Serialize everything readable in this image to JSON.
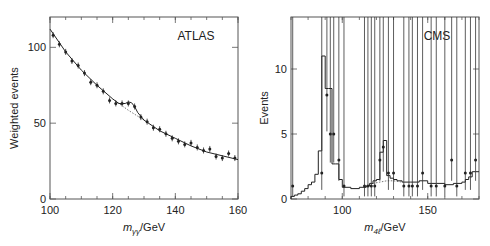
{
  "chart_data": [
    {
      "type": "scatter",
      "title": "",
      "experiment_label": "ATLAS",
      "xlabel": "m_γγ/GeV",
      "xlabel_italic": "m",
      "xlabel_sub": "γγ",
      "xlabel_unit": "/GeV",
      "ylabel": "Weighted events",
      "xlim": [
        100,
        160
      ],
      "ylim": [
        0,
        120
      ],
      "xticks": [
        100,
        120,
        140,
        160
      ],
      "yticks": [
        0,
        50,
        100
      ],
      "grid": false,
      "series": [
        {
          "name": "Data",
          "style": "points-with-errorbars",
          "x": [
            101,
            103,
            105,
            107,
            109,
            111,
            113,
            115,
            117,
            119,
            121,
            123,
            125,
            127,
            129,
            131,
            133,
            135,
            137,
            139,
            141,
            143,
            145,
            147,
            149,
            151,
            153,
            155,
            157,
            159
          ],
          "y": [
            108,
            102,
            97,
            91,
            88,
            83,
            77,
            75,
            71,
            65,
            63,
            63,
            63,
            61,
            54,
            51,
            47,
            46,
            43,
            40,
            38,
            36,
            37,
            34,
            32,
            33,
            28,
            27,
            30,
            27
          ]
        },
        {
          "name": "Signal + background fit",
          "style": "solid-line",
          "x": [
            100,
            105,
            110,
            115,
            120,
            122,
            124,
            125,
            126,
            127,
            128,
            130,
            135,
            140,
            145,
            150,
            155,
            160
          ],
          "y": [
            112,
            97,
            85,
            75,
            66,
            63,
            63,
            64,
            63.5,
            61,
            57,
            52,
            45,
            40,
            35,
            31,
            28.5,
            26
          ]
        },
        {
          "name": "Background-only fit",
          "style": "dotted-line",
          "x": [
            120,
            125,
            130
          ],
          "y": [
            66,
            58.5,
            52
          ]
        }
      ]
    },
    {
      "type": "bar",
      "title": "",
      "experiment_label": "CMS",
      "xlabel": "m_4ℓ/GeV",
      "xlabel_italic": "m",
      "xlabel_sub": "4ℓ",
      "xlabel_unit": "/GeV",
      "ylabel": "Events",
      "xlim": [
        70,
        180
      ],
      "ylim": [
        0,
        14
      ],
      "xticks": [
        100,
        150
      ],
      "yticks": [
        0,
        5,
        10
      ],
      "grid": false,
      "series": [
        {
          "name": "Data",
          "style": "points-with-errorbars",
          "x": [
            71,
            88,
            91,
            93,
            95,
            98,
            101,
            113,
            115,
            117,
            119,
            122,
            124,
            127,
            130,
            136,
            139,
            141,
            144,
            147,
            152,
            155,
            160,
            164,
            167,
            172,
            175,
            178
          ],
          "y": [
            1,
            2,
            8,
            5,
            5,
            3,
            1,
            1,
            1,
            1,
            1,
            3,
            4,
            2,
            2,
            1,
            1,
            1,
            1,
            2,
            1,
            1,
            1,
            3,
            1,
            2,
            2,
            3
          ],
          "err_up": [
            2.3,
            2.6,
            3.9,
            3.3,
            3.3,
            2.9,
            2.3,
            2.3,
            2.3,
            2.3,
            2.3,
            2.9,
            3.2,
            2.6,
            2.6,
            2.3,
            2.3,
            2.3,
            2.3,
            2.6,
            2.3,
            2.3,
            2.3,
            2.9,
            2.3,
            2.6,
            2.6,
            2.9
          ],
          "err_down": [
            0.8,
            1.3,
            2.8,
            2.2,
            2.2,
            1.6,
            0.8,
            0.8,
            0.8,
            0.8,
            0.8,
            1.6,
            1.9,
            1.3,
            1.3,
            0.8,
            0.8,
            0.8,
            0.8,
            1.3,
            0.8,
            0.8,
            0.8,
            1.6,
            0.8,
            1.3,
            1.3,
            1.6
          ]
        },
        {
          "name": "Expected (signal + background)",
          "style": "step-histogram",
          "bin_edges": [
            70,
            72,
            74,
            76,
            78,
            80,
            82,
            84,
            86,
            88,
            90,
            92,
            94,
            96,
            98,
            100,
            105,
            110,
            114,
            116,
            118,
            120,
            122,
            124,
            126,
            128,
            130,
            132,
            135,
            140,
            145,
            150,
            155,
            160,
            165,
            170,
            172,
            174,
            176,
            178,
            180
          ],
          "values": [
            0.2,
            0.3,
            0.4,
            0.6,
            0.8,
            1.1,
            1.3,
            1.9,
            3.7,
            11,
            8.5,
            8.5,
            2.7,
            2.7,
            1.5,
            0.9,
            0.8,
            0.9,
            1.0,
            1.2,
            1.4,
            1.5,
            3.6,
            4.5,
            1.8,
            1.6,
            1.5,
            1.4,
            1.3,
            1.3,
            1.4,
            1.2,
            1.2,
            1.1,
            1.2,
            1.3,
            1.5,
            1.7,
            2.1,
            2.1
          ]
        },
        {
          "name": "Background",
          "style": "dotted-line",
          "x": [
            118,
            122,
            126,
            130,
            135
          ],
          "y": [
            1.2,
            1.3,
            1.4,
            1.4,
            1.3
          ]
        }
      ]
    }
  ]
}
